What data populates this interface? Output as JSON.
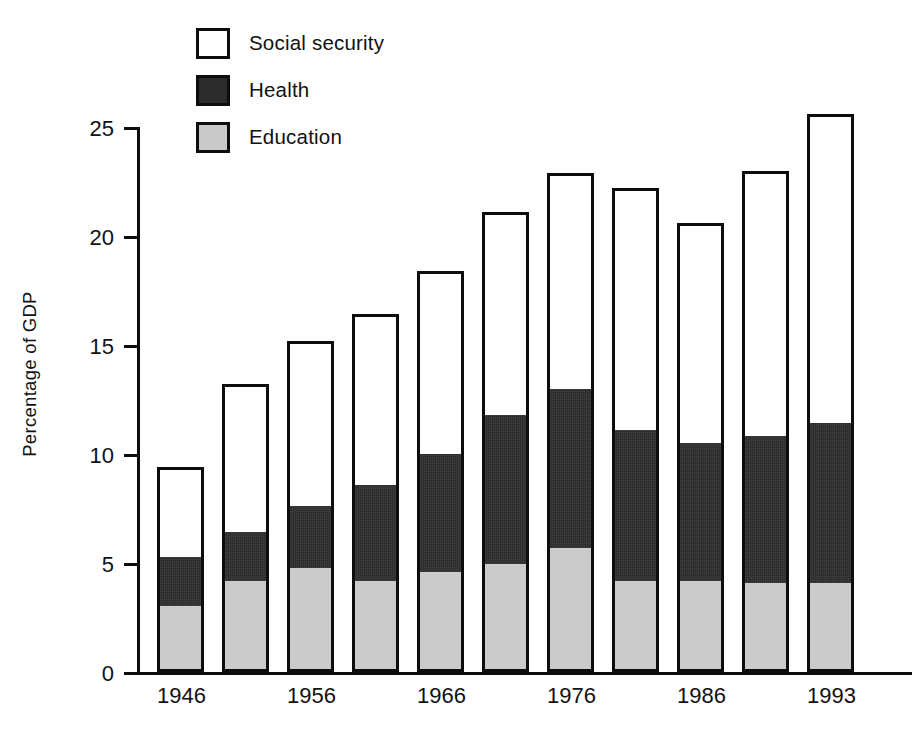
{
  "chart_data": {
    "type": "bar",
    "subtype": "stacked-bar",
    "title": "",
    "xlabel": "",
    "ylabel": "Percentage of GDP",
    "categories": [
      "1946",
      "1951",
      "1956",
      "1961",
      "1966",
      "1971",
      "1976",
      "1981",
      "1986",
      "1991",
      "1993"
    ],
    "x_tick_labels": [
      "1946",
      "",
      "1956",
      "",
      "1966",
      "",
      "1976",
      "",
      "1986",
      "",
      "1993"
    ],
    "y_tick_labels": [
      "0",
      "5",
      "10",
      "15",
      "20",
      "25"
    ],
    "y_ticks": [
      0,
      5,
      10,
      15,
      20,
      25
    ],
    "ylim": [
      0,
      25
    ],
    "grid": false,
    "legend_position": "top-left-inside",
    "stack_order_bottom_to_top": [
      "Education",
      "Health",
      "Social security"
    ],
    "series": [
      {
        "name": "Education",
        "color": "#c9c9c9",
        "values": [
          3.0,
          4.1,
          4.7,
          4.1,
          4.5,
          4.9,
          5.6,
          4.1,
          4.1,
          4.0,
          4.0
        ]
      },
      {
        "name": "Health",
        "color": "#2b2b2b",
        "values": [
          2.3,
          2.3,
          2.9,
          4.5,
          5.5,
          6.9,
          7.4,
          7.0,
          6.4,
          6.8,
          7.4
        ]
      },
      {
        "name": "Social security",
        "color": "#ffffff",
        "values": [
          4.1,
          6.8,
          7.6,
          7.8,
          8.4,
          9.3,
          9.9,
          11.1,
          10.1,
          12.2,
          14.2
        ]
      }
    ],
    "cumulative_tops": {
      "education": [
        3.0,
        4.1,
        4.7,
        4.1,
        4.5,
        4.9,
        5.6,
        4.1,
        4.1,
        4.0,
        4.0
      ],
      "health": [
        5.3,
        6.4,
        7.6,
        8.6,
        10.0,
        11.8,
        13.0,
        11.1,
        10.5,
        10.8,
        11.4
      ],
      "total": [
        9.4,
        13.2,
        15.2,
        16.4,
        18.4,
        21.1,
        22.9,
        22.2,
        20.6,
        23.0,
        25.6
      ]
    }
  },
  "legend": {
    "items": [
      {
        "label": "Social security",
        "color": "#ffffff"
      },
      {
        "label": "Health",
        "color": "#2b2b2b"
      },
      {
        "label": "Education",
        "color": "#c9c9c9"
      }
    ]
  },
  "axes": {
    "y_label": "Percentage of GDP",
    "y_ticks": [
      {
        "label": "25",
        "value": 25
      },
      {
        "label": "20",
        "value": 20
      },
      {
        "label": "15",
        "value": 15
      },
      {
        "label": "10",
        "value": 10
      },
      {
        "label": "5",
        "value": 5
      },
      {
        "label": "0",
        "value": 0
      }
    ],
    "x_ticks": [
      "1946",
      "1956",
      "1966",
      "1976",
      "1986",
      "1993"
    ]
  },
  "colors": {
    "ink": "#0d0d0d",
    "social_security": "#ffffff",
    "health": "#2b2b2b",
    "education": "#c9c9c9",
    "background": "#ffffff"
  }
}
